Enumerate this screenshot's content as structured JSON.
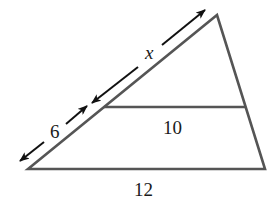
{
  "figure": {
    "type": "triangle-with-parallel-segment",
    "labels": {
      "upper_left_side": "x",
      "lower_left_side": "6",
      "parallel_segment": "10",
      "base": "12"
    },
    "colors": {
      "triangle_stroke": "#555555",
      "arrow_stroke": "#111111",
      "text": "#1a1a1a",
      "background": "#ffffff"
    }
  }
}
